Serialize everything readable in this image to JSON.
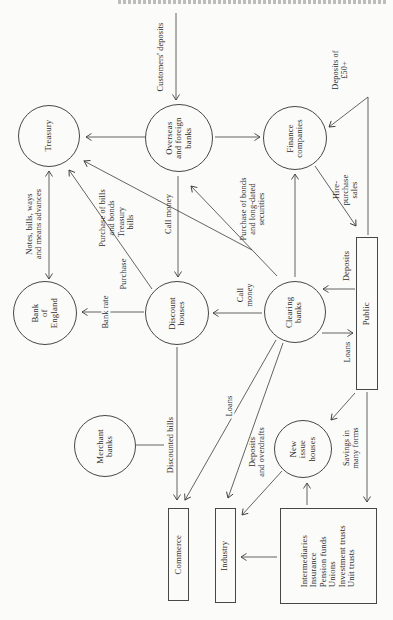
{
  "diagram": {
    "nodes": [
      {
        "id": "treasury",
        "shape": "circle",
        "cx": 49,
        "cy": 136,
        "r": 31,
        "label": "Treasury"
      },
      {
        "id": "overseas-foreign-banks",
        "shape": "circle",
        "cx": 179,
        "cy": 138,
        "r": 34,
        "label": "Overseas\nand foreign\nbanks"
      },
      {
        "id": "finance-companies",
        "shape": "circle",
        "cx": 295,
        "cy": 138,
        "r": 32,
        "label": "Finance\ncompanies"
      },
      {
        "id": "bank-of-england",
        "shape": "circle",
        "cx": 45,
        "cy": 313,
        "r": 32,
        "label": "Bank\nof\nEngland"
      },
      {
        "id": "discount-houses",
        "shape": "circle",
        "cx": 177,
        "cy": 313,
        "r": 32,
        "label": "Discount\nhouses"
      },
      {
        "id": "clearing-banks",
        "shape": "circle",
        "cx": 295,
        "cy": 312,
        "r": 31,
        "label": "Clearing\nbanks"
      },
      {
        "id": "merchant-banks",
        "shape": "circle",
        "cx": 105,
        "cy": 446,
        "r": 31,
        "label": "Merchant\nbanks"
      },
      {
        "id": "new-issue-houses",
        "shape": "circle",
        "cx": 303,
        "cy": 449,
        "r": 29,
        "label": "New\nissue\nhouses"
      },
      {
        "id": "public",
        "shape": "rect",
        "x": 356,
        "y": 237,
        "w": 22,
        "h": 153,
        "label": "Public"
      },
      {
        "id": "commerce",
        "shape": "rect",
        "x": 168,
        "y": 508,
        "w": 21,
        "h": 93,
        "label": "Commerce"
      },
      {
        "id": "industry",
        "shape": "rect",
        "x": 215,
        "y": 508,
        "w": 21,
        "h": 95,
        "label": "Industry"
      },
      {
        "id": "intermediaries",
        "shape": "rect",
        "x": 280,
        "y": 508,
        "w": 97,
        "h": 96,
        "align": "left",
        "label": "Intermediaries\nInsurance\nPension funds\nUnions\nInvestment trusts\nUnit trusts"
      }
    ],
    "edges": [
      {
        "id": "customers-deposits",
        "points": [
          [
            176,
            13
          ],
          [
            176,
            100
          ]
        ],
        "arrow": "end"
      },
      {
        "id": "overseas-to-treasury",
        "points": [
          [
            145,
            137
          ],
          [
            86,
            137
          ]
        ],
        "arrow": "end"
      },
      {
        "id": "treasury-boe-notes",
        "points": [
          [
            49,
            171
          ],
          [
            49,
            279
          ]
        ],
        "arrow": "both"
      },
      {
        "id": "discount-to-treasury",
        "points": [
          [
            152,
            289
          ],
          [
            69,
            170
          ]
        ],
        "arrow": "end"
      },
      {
        "id": "clearing-to-treasury",
        "points": [
          [
            252,
            250
          ],
          [
            84,
            161
          ]
        ],
        "arrow": "end"
      },
      {
        "id": "overseas-to-discount-call-money",
        "points": [
          [
            178,
            176
          ],
          [
            178,
            277
          ]
        ],
        "arrow": "end"
      },
      {
        "id": "clearing-to-overseas-bonds",
        "points": [
          [
            277,
            276
          ],
          [
            191,
            186
          ]
        ],
        "arrow": "end"
      },
      {
        "id": "clearing-to-finance",
        "points": [
          [
            295,
            277
          ],
          [
            295,
            174
          ]
        ],
        "arrow": "end"
      },
      {
        "id": "overseas-to-finance",
        "points": [
          [
            215,
            137
          ],
          [
            260,
            137
          ]
        ],
        "arrow": "end"
      },
      {
        "id": "public-to-finance-deposits50",
        "points": [
          [
            368,
            235
          ],
          [
            368,
            97
          ],
          [
            329,
            127
          ]
        ],
        "arrow": "end"
      },
      {
        "id": "finance-to-public-hire-purchase",
        "points": [
          [
            315,
            166
          ],
          [
            356,
            226
          ]
        ],
        "arrow": "end"
      },
      {
        "id": "public-to-clearing-deposits",
        "points": [
          [
            355,
            289
          ],
          [
            323,
            289
          ]
        ],
        "arrow": "end"
      },
      {
        "id": "clearing-to-public-loans",
        "points": [
          [
            322,
            333
          ],
          [
            353,
            333
          ]
        ],
        "arrow": "end"
      },
      {
        "id": "clearing-to-commerce-loans",
        "points": [
          [
            276,
            340
          ],
          [
            185,
            500
          ]
        ],
        "arrow": "end"
      },
      {
        "id": "clearing-to-industry-deposits",
        "points": [
          [
            283,
            343
          ],
          [
            228,
            498
          ]
        ],
        "arrow": "end"
      },
      {
        "id": "merchant-join",
        "points": [
          [
            136,
            445
          ],
          [
            164,
            445
          ]
        ],
        "arrow": "none"
      },
      {
        "id": "discount-to-commerce-bills",
        "points": [
          [
            177,
            347
          ],
          [
            177,
            500
          ]
        ],
        "arrow": "end"
      },
      {
        "id": "public-to-new-issue",
        "points": [
          [
            355,
            393
          ],
          [
            331,
            420
          ]
        ],
        "arrow": "end"
      },
      {
        "id": "new-issue-to-industry",
        "points": [
          [
            282,
            471
          ],
          [
            242,
            515
          ]
        ],
        "arrow": "end"
      },
      {
        "id": "intermediaries-to-new-issue",
        "points": [
          [
            307,
            505
          ],
          [
            307,
            483
          ]
        ],
        "arrow": "end"
      },
      {
        "id": "public-to-intermediaries-savings",
        "points": [
          [
            367,
            392
          ],
          [
            367,
            502
          ]
        ],
        "arrow": "end"
      },
      {
        "id": "intermediaries-to-industry",
        "points": [
          [
            277,
            557
          ],
          [
            241,
            557
          ]
        ],
        "arrow": "end"
      },
      {
        "id": "discount-to-boe-bank-rate",
        "points": [
          [
            144,
            312
          ],
          [
            82,
            312
          ]
        ],
        "arrow": "end"
      },
      {
        "id": "clearing-to-discount-call-money",
        "points": [
          [
            262,
            313
          ],
          [
            213,
            313
          ]
        ],
        "arrow": "end"
      }
    ],
    "edge_labels": [
      {
        "id": "customers-deposits",
        "x": 161,
        "y": 57,
        "text": "Customers' deposits"
      },
      {
        "id": "purchase-bills-bonds",
        "x": 107,
        "y": 218,
        "text": "Purchase of bills\nand bonds"
      },
      {
        "id": "notes-bills-ways",
        "x": 34,
        "y": 224,
        "text": "Notes, bills, ways\nand means advances"
      },
      {
        "id": "treasury-bills",
        "x": 126,
        "y": 222,
        "text": "Treasury\nbills"
      },
      {
        "id": "purchase",
        "x": 124,
        "y": 274,
        "text": "Purchase"
      },
      {
        "id": "call-money-1",
        "x": 169,
        "y": 214,
        "text": "Call money"
      },
      {
        "id": "purchase-bonds-long-dated",
        "x": 253,
        "y": 209,
        "text": "Purchase of bonds\nand long-dated\nsecurities"
      },
      {
        "id": "deposits-of-50",
        "x": 340,
        "y": 70,
        "text": "Deposits of £50+"
      },
      {
        "id": "hire-purchase-sales",
        "x": 346,
        "y": 190,
        "text": "Hire-\npurchase\nsales"
      },
      {
        "id": "deposits-public",
        "x": 347,
        "y": 266,
        "text": "Deposits"
      },
      {
        "id": "loans-public",
        "x": 348,
        "y": 352,
        "text": "Loans"
      },
      {
        "id": "loans-commerce",
        "x": 230,
        "y": 406,
        "bg": true,
        "text": "Loans"
      },
      {
        "id": "deposits-and-overdrafts",
        "x": 257,
        "y": 452,
        "text": "Deposits\nand overdrafts"
      },
      {
        "id": "discounted-bills",
        "x": 171,
        "y": 445,
        "text": "Discounted bills"
      },
      {
        "id": "savings-many-forms",
        "x": 351,
        "y": 448,
        "text": "Savings in\nmany forms"
      },
      {
        "id": "bank-rate",
        "x": 106,
        "y": 312,
        "bg": true,
        "text": "Bank rate"
      },
      {
        "id": "call-money-2",
        "x": 245,
        "y": 295,
        "text": "Call\nmoney"
      }
    ]
  }
}
